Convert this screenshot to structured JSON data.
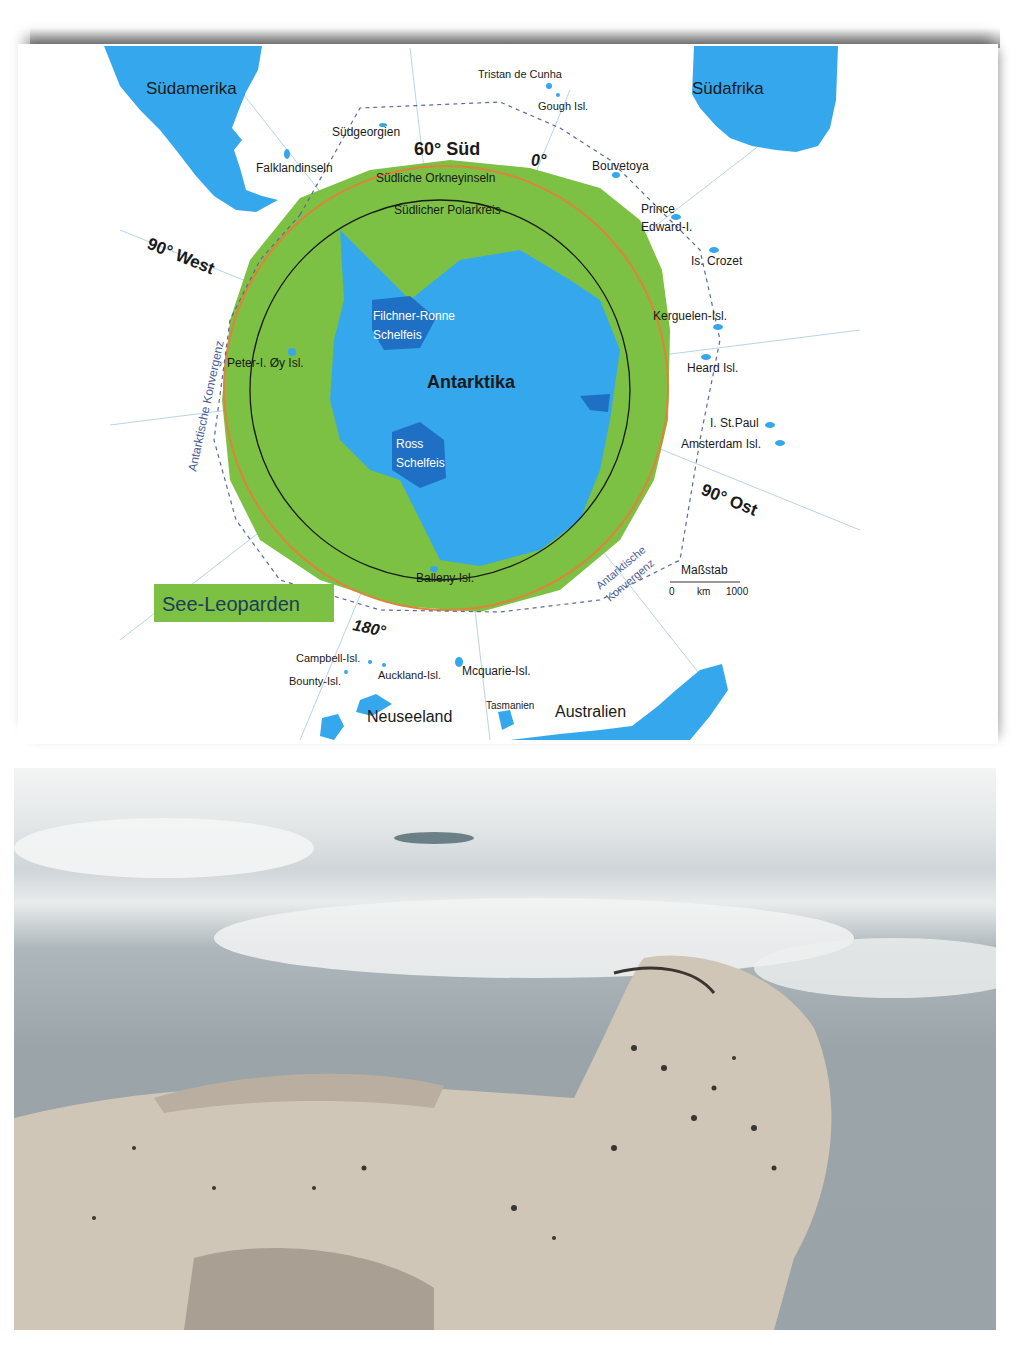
{
  "map": {
    "continents": [
      "Südamerika",
      "Südafrika",
      "Antarktika",
      "Neuseeland",
      "Australien"
    ],
    "ice_shelves": [
      "Filchner-Ronne Schelfeis",
      "Ross Schelfeis"
    ],
    "islands": [
      "Tristan de Cunha",
      "Gough Isl.",
      "Südgeorgien",
      "Falklandinseln",
      "Südliche Orkneyinseln",
      "Bouvetoya",
      "Prince Edward-I.",
      "Is. Crozet",
      "Kerguelen-Isl.",
      "Heard Isl.",
      "I. St.Paul",
      "Amsterdam Isl.",
      "Peter-I. Øy Isl.",
      "Balleny Isl.",
      "Campbell-Isl.",
      "Bounty-Isl.",
      "Auckland-Isl.",
      "Mcquarie-Isl.",
      "Tasmanien"
    ],
    "lines": {
      "lat60": "60° Süd",
      "polar_circle": "Südlicher Polarkreis",
      "convergence": "Antarktische Konvergenz"
    },
    "meridians": {
      "zero": "0°",
      "west": "90° West",
      "east": "90° Ost",
      "dateline": "180°"
    },
    "legend_label": "See-Leoparden",
    "scale": {
      "title": "Maßstab",
      "zero": "0",
      "unit": "km",
      "max": "1000"
    },
    "colors": {
      "land": "#35a7ec",
      "shelf": "#1f6fc4",
      "range": "#7cc143",
      "lat60": "#e0823a",
      "convergence": "#5a6a9a"
    }
  },
  "photo": {
    "subject": "leopard seal on ice"
  }
}
